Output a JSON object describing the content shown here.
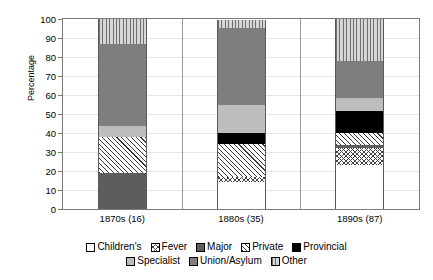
{
  "chart_data": {
    "type": "bar",
    "variant": "stacked-100-percent",
    "title": "",
    "subtitle": "",
    "xlabel": "",
    "ylabel": "Percentage",
    "ylim": [
      0,
      100
    ],
    "yticks": [
      0,
      10,
      20,
      30,
      40,
      50,
      60,
      70,
      80,
      90,
      100
    ],
    "ytick_labels": [
      "0",
      "10",
      "20",
      "30",
      "40",
      "50",
      "60",
      "70",
      "80",
      "90",
      "100"
    ],
    "grid": true,
    "grid_axis": "y",
    "legend_position": "bottom",
    "categories": [
      "1870s (16)",
      "1880s (35)",
      "1890s (87)"
    ],
    "series": [
      {
        "name": "Children's",
        "pattern": "solid-white",
        "color": "#ffffff",
        "values": [
          0,
          14,
          23
        ]
      },
      {
        "name": "Fever",
        "pattern": "cross-hatch",
        "color": "#ffffff",
        "values": [
          0,
          3,
          9
        ]
      },
      {
        "name": "Major",
        "pattern": "solid-dark-gray",
        "color": "#5d5d5d",
        "values": [
          19,
          0,
          1.5
        ]
      },
      {
        "name": "Private",
        "pattern": "diagonal-hatch",
        "color": "#ffffff",
        "values": [
          19,
          17,
          6.5
        ]
      },
      {
        "name": "Provincial",
        "pattern": "solid-black",
        "color": "#000000",
        "values": [
          0,
          6,
          11.5
        ]
      },
      {
        "name": "Specialist",
        "pattern": "solid-light-gray",
        "color": "#bdbdbd",
        "values": [
          5.5,
          14.5,
          7
        ]
      },
      {
        "name": "Union/Asylum",
        "pattern": "solid-mid-gray",
        "color": "#7e7e7e",
        "values": [
          43.5,
          41,
          19.5
        ]
      },
      {
        "name": "Other",
        "pattern": "vertical-lines",
        "color": "#d6d6d6",
        "values": [
          13,
          4,
          22
        ]
      }
    ],
    "stack_boundaries": {
      "1870s (16)": [
        0,
        0,
        0,
        19,
        38,
        38,
        43.5,
        87,
        100
      ],
      "1880s (35)": [
        0,
        14,
        17,
        17,
        34,
        40,
        54.5,
        95.5,
        100
      ],
      "1890s (87)": [
        0,
        23,
        32,
        33.5,
        40,
        51.5,
        58.5,
        78,
        100
      ]
    }
  },
  "legend": {
    "row1": [
      "Children's",
      "Fever",
      "Major",
      "Private",
      "Provincial"
    ],
    "row2": [
      "Specialist",
      "Union/Asylum",
      "Other"
    ]
  }
}
